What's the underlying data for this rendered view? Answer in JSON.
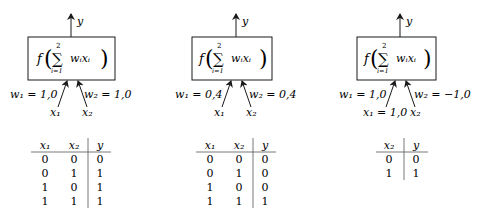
{
  "arrow_color": "#1a1a1a",
  "text_color": "#1a1a1a",
  "panels": [
    {
      "id": "or",
      "output_label": "y",
      "function_label": "f",
      "sum_upper": "2",
      "sum_lower": "i=1",
      "sum_term": "wᵢxᵢ",
      "w1_label": "w₁ = 1,0",
      "w2_label": "w₂ = 1,0",
      "x1_label": "x₁",
      "x2_label": "x₂",
      "table": {
        "headers": [
          "x₁",
          "x₂",
          "y"
        ],
        "rows": [
          [
            "0",
            "0",
            "0"
          ],
          [
            "0",
            "1",
            "1"
          ],
          [
            "1",
            "0",
            "1"
          ],
          [
            "1",
            "1",
            "1"
          ]
        ]
      }
    },
    {
      "id": "and",
      "output_label": "y",
      "function_label": "f",
      "sum_upper": "2",
      "sum_lower": "i=1",
      "sum_term": "wᵢxᵢ",
      "w1_label": "w₁ = 0,4",
      "w2_label": "w₂ = 0,4",
      "x1_label": "x₁",
      "x2_label": "x₂",
      "table": {
        "headers": [
          "x₁",
          "x₂",
          "y"
        ],
        "rows": [
          [
            "0",
            "0",
            "0"
          ],
          [
            "0",
            "1",
            "0"
          ],
          [
            "1",
            "0",
            "0"
          ],
          [
            "1",
            "1",
            "1"
          ]
        ]
      }
    },
    {
      "id": "fixed-x1",
      "output_label": "y",
      "function_label": "f",
      "sum_upper": "2",
      "sum_lower": "i=1",
      "sum_term": "wᵢxᵢ",
      "w1_label": "w₁ = 1,0",
      "w2_label": "w₂ = −1,0",
      "x1_label": "x₁ = 1,0",
      "x2_label": "x₂",
      "table": {
        "headers": [
          "x₂",
          "y"
        ],
        "rows": [
          [
            "0",
            "0"
          ],
          [
            "1",
            "1"
          ]
        ]
      }
    }
  ]
}
